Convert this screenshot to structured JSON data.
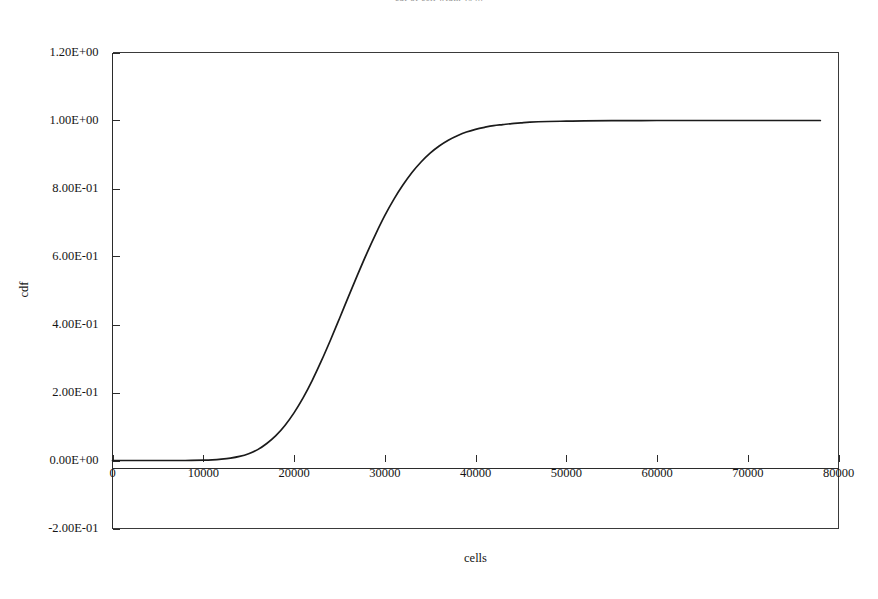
{
  "chart_data": {
    "type": "line",
    "title": "cdf of cell width vs ...",
    "title_visible": false,
    "xlabel": "cells",
    "ylabel": "cdf",
    "xlim": [
      0,
      80000
    ],
    "ylim": [
      -0.2,
      1.2
    ],
    "xticks": [
      0,
      10000,
      20000,
      30000,
      40000,
      50000,
      60000,
      70000,
      80000
    ],
    "xtick_labels": [
      "0",
      "10000",
      "20000",
      "30000",
      "40000",
      "50000",
      "60000",
      "70000",
      "80000"
    ],
    "yticks": [
      -0.2,
      0.0,
      0.2,
      0.4,
      0.6,
      0.8,
      1.0,
      1.2
    ],
    "ytick_labels": [
      "-2.00E-01",
      "0.00E+00",
      "2.00E-01",
      "4.00E-01",
      "6.00E-01",
      "8.00E-01",
      "1.00E+00",
      "1.20E+00"
    ],
    "grid": false,
    "legend": false,
    "series": [
      {
        "name": "cdf",
        "color": "#1b1b1b",
        "x": [
          0,
          2000,
          4000,
          6000,
          8000,
          10000,
          11000,
          12000,
          13000,
          14000,
          15000,
          16000,
          17000,
          18000,
          19000,
          20000,
          21000,
          22000,
          23000,
          24000,
          25000,
          26000,
          27000,
          28000,
          29000,
          30000,
          31000,
          32000,
          33000,
          34000,
          35000,
          36000,
          37000,
          38000,
          39000,
          40000,
          41000,
          42000,
          43000,
          44000,
          45000,
          46000,
          48000,
          50000,
          52000,
          55000,
          60000,
          65000,
          70000,
          75000,
          78000
        ],
        "y": [
          0.0,
          0.0,
          0.0,
          0.0,
          0.0,
          0.001,
          0.002,
          0.004,
          0.007,
          0.012,
          0.02,
          0.032,
          0.05,
          0.073,
          0.103,
          0.14,
          0.184,
          0.235,
          0.292,
          0.353,
          0.417,
          0.482,
          0.546,
          0.608,
          0.666,
          0.72,
          0.768,
          0.81,
          0.847,
          0.878,
          0.904,
          0.925,
          0.942,
          0.955,
          0.966,
          0.974,
          0.98,
          0.985,
          0.988,
          0.991,
          0.993,
          0.995,
          0.997,
          0.998,
          0.999,
          0.9995,
          1.0,
          1.0,
          1.0,
          1.0,
          1.0
        ]
      }
    ]
  },
  "axes": {
    "y_title": "cdf",
    "x_title": "cells"
  }
}
